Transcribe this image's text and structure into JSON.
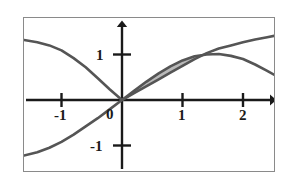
{
  "figure": {
    "name": "two-curve-plot-with-shaded-region",
    "border_color": "#8a8a8a",
    "background": "#ffffff"
  },
  "chart_data": {
    "type": "line",
    "title": "",
    "xlabel": "",
    "ylabel": "",
    "xlim": [
      -1.62,
      2.52
    ],
    "ylim": [
      -1.85,
      1.6
    ],
    "grid": false,
    "legend": null,
    "axis_style": "arrows-both-ends",
    "xticks": [
      -1,
      1,
      2
    ],
    "xtick_labels": [
      "-1",
      "1",
      "2"
    ],
    "yticks": [
      1,
      -1
    ],
    "ytick_labels": [
      "1",
      "-1"
    ],
    "origin_label": "0",
    "curve_color": "#555555",
    "axis_color": "#1a1a1a",
    "shade_color": "#b9b9b9",
    "shade_region": {
      "label": "area-between-curves",
      "x_start": 0,
      "x_end": 1.3,
      "upper_series": "sine-curve",
      "lower_series": "arctan-like-curve"
    },
    "series": [
      {
        "name": "sine-curve",
        "description": "S-shaped curve rising through origin, peaking near x=1.6",
        "x": [
          -1.62,
          -1.4,
          -1.2,
          -1.0,
          -0.8,
          -0.6,
          -0.4,
          -0.2,
          0.0,
          0.2,
          0.4,
          0.6,
          0.8,
          1.0,
          1.2,
          1.4,
          1.6,
          1.8,
          2.0,
          2.2,
          2.4,
          2.52
        ],
        "y": [
          -1.22,
          -1.15,
          -1.05,
          -0.92,
          -0.76,
          -0.58,
          -0.4,
          -0.2,
          0.0,
          0.2,
          0.4,
          0.58,
          0.74,
          0.87,
          0.96,
          1.0,
          1.01,
          0.97,
          0.9,
          0.78,
          0.64,
          0.55
        ]
      },
      {
        "name": "arctan-like-curve",
        "description": "Decreasing-then-rising curve, high at left edge, crosses sine near x=1.3",
        "x": [
          -1.62,
          -1.4,
          -1.2,
          -1.0,
          -0.8,
          -0.6,
          -0.4,
          -0.2,
          0.0,
          0.2,
          0.4,
          0.6,
          0.8,
          1.0,
          1.2,
          1.4,
          1.6,
          1.8,
          2.0,
          2.2,
          2.4,
          2.52
        ],
        "y": [
          1.32,
          1.27,
          1.2,
          1.09,
          0.92,
          0.72,
          0.48,
          0.23,
          0.0,
          0.15,
          0.3,
          0.45,
          0.6,
          0.75,
          0.9,
          1.03,
          1.13,
          1.2,
          1.27,
          1.33,
          1.38,
          1.41
        ]
      }
    ]
  }
}
